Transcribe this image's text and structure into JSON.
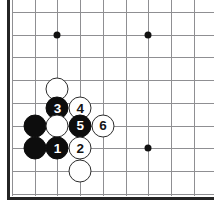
{
  "diagram": {
    "type": "go-board-diagram",
    "game": "Go",
    "caption": "",
    "board": {
      "corner_shown": "upper-left",
      "grid_spacing_px": 22.7,
      "origin_x_px": 12,
      "origin_y_px": 12,
      "columns": 9,
      "rows": 9,
      "line_color": "#8f8f92",
      "edge_color": "#242424",
      "background_color": "#ffffff",
      "edges": {
        "left": true,
        "bottom": true,
        "top": false,
        "right": false
      }
    },
    "star_points": [
      {
        "name": "star-point-upper-left",
        "col": 2,
        "row": 1
      },
      {
        "name": "star-point-upper-right",
        "col": 6,
        "row": 1
      },
      {
        "name": "star-point-lower-right",
        "col": 6,
        "row": 6
      }
    ],
    "stones": [
      {
        "name": "white-stone-plain-top",
        "color": "white",
        "col": 2,
        "row": 3.4,
        "label": ""
      },
      {
        "name": "black-stone-move-3",
        "color": "black",
        "col": 2,
        "row": 4.25,
        "label": "3"
      },
      {
        "name": "white-stone-move-4",
        "color": "white",
        "col": 3,
        "row": 4.25,
        "label": "4"
      },
      {
        "name": "black-stone-plain-left-upper",
        "color": "black",
        "col": 1,
        "row": 5,
        "label": ""
      },
      {
        "name": "white-stone-plain-center",
        "color": "white",
        "col": 2,
        "row": 5,
        "label": ""
      },
      {
        "name": "black-stone-move-5",
        "color": "black",
        "col": 3,
        "row": 5,
        "label": "5"
      },
      {
        "name": "white-stone-move-6",
        "color": "white",
        "col": 4,
        "row": 5,
        "label": "6"
      },
      {
        "name": "black-stone-plain-left-lower",
        "color": "black",
        "col": 1,
        "row": 6,
        "label": ""
      },
      {
        "name": "black-stone-move-1",
        "color": "black",
        "col": 2,
        "row": 6,
        "label": "1"
      },
      {
        "name": "white-stone-move-2",
        "color": "white",
        "col": 3,
        "row": 6,
        "label": "2"
      },
      {
        "name": "white-stone-plain-bottom",
        "color": "white",
        "col": 3,
        "row": 7,
        "label": ""
      }
    ],
    "move_sequence": [
      {
        "move": 1,
        "color": "black",
        "label": "1"
      },
      {
        "move": 2,
        "color": "white",
        "label": "2"
      },
      {
        "move": 3,
        "color": "black",
        "label": "3"
      },
      {
        "move": 4,
        "color": "white",
        "label": "4"
      },
      {
        "move": 5,
        "color": "black",
        "label": "5"
      },
      {
        "move": 6,
        "color": "white",
        "label": "6"
      }
    ]
  }
}
